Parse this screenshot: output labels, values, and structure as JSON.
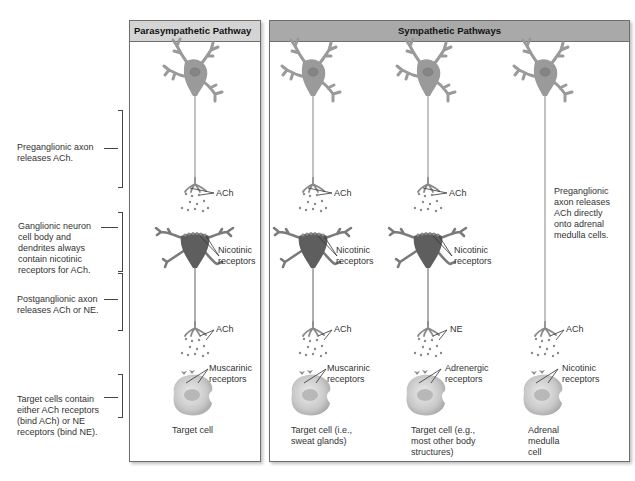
{
  "panels": {
    "left_title": "Parasympathetic Pathway",
    "right_title": "Sympathetic Pathways"
  },
  "side_labels": [
    {
      "text": "Preganglionic axon releases ACh."
    },
    {
      "text": "Ganglionic neuron cell body and dendrites always contain nicotinic receptors for ACh."
    },
    {
      "text": "Postganglionic axon releases ACh or NE."
    },
    {
      "text": "Target cells contain either ACh receptors (bind ACh) or NE receptors (bind NE)."
    }
  ],
  "columns": [
    {
      "name": "parasympathetic",
      "pre_neurotransmitter": "ACh",
      "ganglion_receptor": "Nicotinic receptors",
      "post_neurotransmitter": "ACh",
      "target_receptor": "Muscarinic receptors",
      "target_caption": "Target cell"
    },
    {
      "name": "sympathetic-sweat",
      "pre_neurotransmitter": "ACh",
      "ganglion_receptor": "Nicotinic receptors",
      "post_neurotransmitter": "ACh",
      "target_receptor": "Muscarinic receptors",
      "target_caption": "Target cell (i.e., sweat glands)"
    },
    {
      "name": "sympathetic-most",
      "pre_neurotransmitter": "ACh",
      "ganglion_receptor": "Nicotinic receptors",
      "post_neurotransmitter": "NE",
      "target_receptor": "Adrenergic receptors",
      "target_caption": "Target cell (e.g., most other body structures)"
    },
    {
      "name": "sympathetic-adrenal",
      "direct_note": "Preganglionic axon releases ACh directly onto adrenal medulla cells.",
      "post_neurotransmitter": "ACh",
      "target_receptor": "Nicotinic receptors",
      "target_caption": "Adrenal medulla cell"
    }
  ],
  "colors": {
    "left_header": "#d4d4d4",
    "right_header": "#a9a9a9",
    "neuron_light": "#9a9a9a",
    "neuron_dark": "#5e5e5e",
    "target_cell": "#d6d6d6"
  }
}
